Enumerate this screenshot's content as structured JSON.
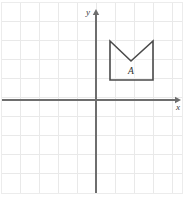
{
  "canvas": {
    "width": 187,
    "height": 199,
    "background": "#ffffff"
  },
  "grid": {
    "cell_size": 19.1,
    "line_color": "#e9e9e9",
    "border_color": "#ececec",
    "left": 1,
    "top": 2,
    "right": 182,
    "bottom": 193,
    "columns": 9,
    "rows": 10,
    "visible": true
  },
  "axes": {
    "origin_x": 96,
    "origin_y": 100,
    "color": "#6e6e6e",
    "x_axis": {
      "label": "x",
      "label_x": 176,
      "label_y": 110,
      "start_x": 2,
      "end_x": 181,
      "arrow_direction": "right"
    },
    "y_axis": {
      "label": "y",
      "label_x": 86,
      "label_y": 15,
      "start_y": 193,
      "end_y": 9,
      "arrow_direction": "up"
    }
  },
  "shapes": [
    {
      "name": "figure-a",
      "label": "A",
      "label_x": 131,
      "label_y": 74,
      "points": "110,41 110,80 153,80 153,41 131,61",
      "vertices": [
        {
          "px_x": 110,
          "px_y": 41,
          "grid_x": 1,
          "grid_y": 3
        },
        {
          "px_x": 110,
          "px_y": 80,
          "grid_x": 1,
          "grid_y": 1
        },
        {
          "px_x": 153,
          "px_y": 80,
          "grid_x": 3,
          "grid_y": 1
        },
        {
          "px_x": 153,
          "px_y": 41,
          "grid_x": 3,
          "grid_y": 3
        },
        {
          "px_x": 131,
          "px_y": 61,
          "grid_x": 2,
          "grid_y": 2
        }
      ],
      "stroke_color": "#4a4a4a",
      "fill_color": "#ffffff",
      "description": "square-with-v-notch-top"
    }
  ]
}
